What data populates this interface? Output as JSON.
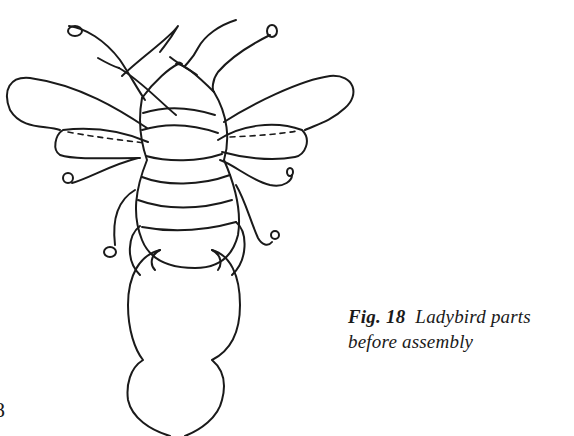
{
  "figure": {
    "subject": "Ladybird parts before assembly",
    "parts": [
      "antennae",
      "head",
      "upper wings",
      "lower wings",
      "striped body",
      "legs",
      "tail/base piece"
    ]
  },
  "caption": {
    "label": "Fig. 18",
    "text_line1": "Ladybird parts",
    "text_line2": "before assembly"
  },
  "page": {
    "number_fragment": "8"
  }
}
